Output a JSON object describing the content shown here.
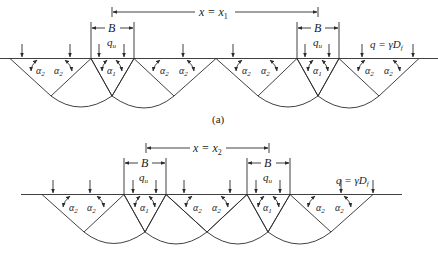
{
  "figure": {
    "panels": [
      {
        "id": "a",
        "caption": "(a)",
        "spacing_label": "x = x",
        "spacing_sub": "1",
        "footing_width_label": "B",
        "bearing_label": "q",
        "bearing_sub": "u",
        "surcharge_label": "q = γD",
        "surcharge_sub": "f",
        "angle_inner": "α",
        "angle_inner_sub": "1",
        "angle_outer": "α",
        "angle_outer_sub": "2"
      },
      {
        "id": "b",
        "caption": "",
        "spacing_label": "x = x",
        "spacing_sub": "2",
        "footing_width_label": "B",
        "bearing_label": "q",
        "bearing_sub": "u",
        "surcharge_label": "q = γD",
        "surcharge_sub": "f",
        "angle_inner": "α",
        "angle_inner_sub": "1",
        "angle_outer": "α",
        "angle_outer_sub": "2"
      }
    ]
  }
}
